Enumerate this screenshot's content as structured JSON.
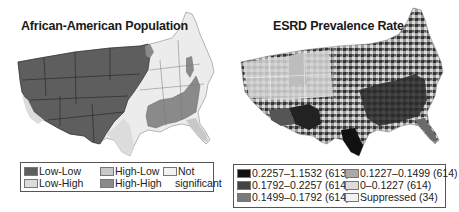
{
  "figure": {
    "panels": [
      {
        "title": "African-American Population",
        "legend": [
          {
            "label": "Low-Low",
            "color": "#5e5e5e"
          },
          {
            "label": "High-Low",
            "color": "#c8c8c8"
          },
          {
            "label": "Not",
            "label2": "significant",
            "color": "#f2f2f2"
          },
          {
            "label": "Low-High",
            "color": "#dcdcdc"
          },
          {
            "label": "High-High",
            "color": "#8a8a8a"
          }
        ]
      },
      {
        "title": "ESRD Prevalence Rate",
        "legend": [
          {
            "label": "0.2257–1.1532 (613)",
            "color": "#111111"
          },
          {
            "label": "0.1792–0.2257 (614)",
            "color": "#444444"
          },
          {
            "label": "0.1499–0.1792 (614)",
            "color": "#7a7a7a"
          },
          {
            "label": "0.1227–0.1499 (614)",
            "color": "#a8a8a8"
          },
          {
            "label": "0–0.1227 (614)",
            "color": "#dcdcdc"
          },
          {
            "label": "Suppressed (34)",
            "color": "#f2f2f2"
          }
        ]
      }
    ]
  }
}
